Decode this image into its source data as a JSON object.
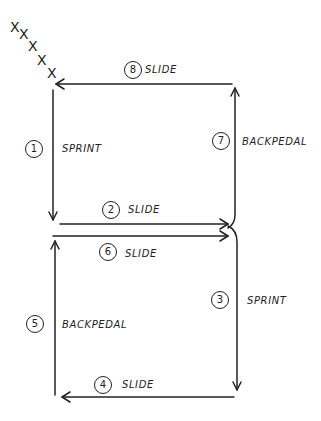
{
  "diagram": {
    "start_marks": [
      "X",
      "X",
      "X",
      "X",
      "X"
    ],
    "stroke_color": "#222222",
    "background": "#ffffff",
    "steps": [
      {
        "number": "1",
        "action": "SPRINT",
        "direction": "down"
      },
      {
        "number": "2",
        "action": "SLIDE",
        "direction": "right"
      },
      {
        "number": "3",
        "action": "SPRINT",
        "direction": "down"
      },
      {
        "number": "4",
        "action": "SLIDE",
        "direction": "left"
      },
      {
        "number": "5",
        "action": "BACKPEDAL",
        "direction": "up"
      },
      {
        "number": "6",
        "action": "SLIDE",
        "direction": "right"
      },
      {
        "number": "7",
        "action": "BACKPEDAL",
        "direction": "up"
      },
      {
        "number": "8",
        "action": "SLIDE",
        "direction": "left"
      }
    ]
  }
}
